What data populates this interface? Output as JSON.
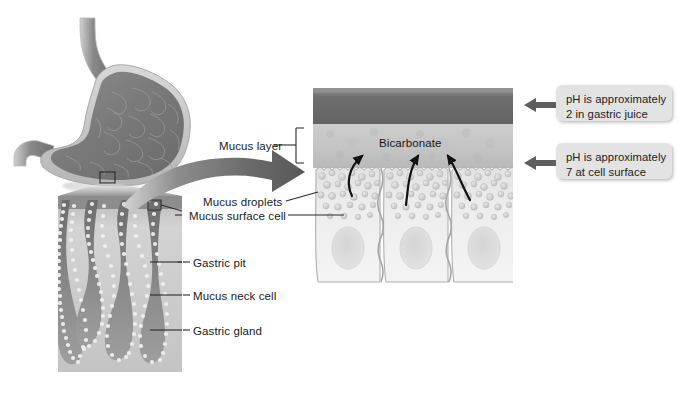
{
  "figure": {
    "background_color": "#ffffff"
  },
  "labels": {
    "mucus_layer": "Mucus layer",
    "bicarbonate": "Bicarbonate",
    "mucus_droplets": "Mucus droplets",
    "mucus_surface_cell": "Mucus surface cell",
    "gastric_pit": "Gastric pit",
    "mucus_neck_cell": "Mucus neck cell",
    "gastric_gland": "Gastric gland"
  },
  "callouts": [
    {
      "id": "callout-gastric-juice",
      "text": "pH is approximately\n2 in gastric juice",
      "ph_value": "2",
      "location": "gastric juice"
    },
    {
      "id": "callout-cell-surface",
      "text": "pH is approximately\n7 at cell surface",
      "ph_value": "7",
      "location": "cell surface"
    }
  ],
  "panels": {
    "stomach": {
      "name": "stomach-illustration",
      "description": "whole stomach with esophagus and duodenum, rugae visible"
    },
    "histology": {
      "name": "gastric-gland-micrograph",
      "description": "light micrograph of gastric pits and glands"
    },
    "cells": {
      "name": "surface-epithelium-detail",
      "description": "three columnar mucus surface cells with nuclei and apical mucus droplets"
    }
  },
  "colors": {
    "gastric_juice_band": "#6e6e6e",
    "mucus_layer": "#c9c9c9",
    "cell_body": "#ececec",
    "cell_outline": "#a8a8a8",
    "droplet": "#cfcfcf",
    "nucleus": "#dcdcdc",
    "callout_bg": "#e3e3e3",
    "arrow": "#5a5a5a",
    "leader_line": "#2b2b2b",
    "text": "#1b1b1b"
  }
}
